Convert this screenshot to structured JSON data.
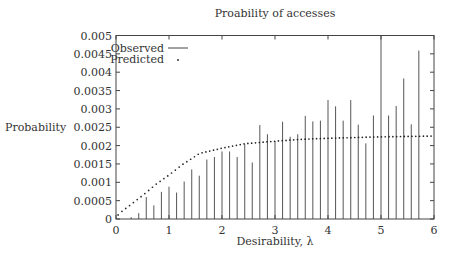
{
  "chart_data": {
    "type": "bar",
    "title": "Proability of accesses",
    "xlabel": "Desirability, λ",
    "ylabel": "Probability",
    "xlim": [
      0,
      6
    ],
    "ylim": [
      0,
      0.005
    ],
    "grid": false,
    "legend_position": "top-left",
    "x_ticks": [
      "0",
      "1",
      "2",
      "3",
      "4",
      "5",
      "6"
    ],
    "y_ticks": [
      "0",
      "0.0005",
      "0.001",
      "0.0015",
      "0.002",
      "0.0025",
      "0.003",
      "0.0035",
      "0.004",
      "0.0045",
      "0.005"
    ],
    "series": [
      {
        "name": "Observed",
        "style": "impulses",
        "x": [
          0.143,
          0.286,
          0.429,
          0.571,
          0.714,
          0.857,
          1.0,
          1.143,
          1.286,
          1.429,
          1.571,
          1.714,
          1.857,
          2.0,
          2.143,
          2.286,
          2.429,
          2.571,
          2.714,
          2.857,
          3.0,
          3.143,
          3.286,
          3.429,
          3.571,
          3.714,
          3.857,
          4.0,
          4.143,
          4.286,
          4.429,
          4.571,
          4.714,
          4.857,
          5.0,
          5.143,
          5.286,
          5.429,
          5.571,
          5.714
        ],
        "values": [
          0.0,
          5e-05,
          0.00016,
          0.0006,
          0.00037,
          0.00074,
          0.00088,
          0.00072,
          0.00102,
          0.00135,
          0.00118,
          0.00162,
          0.00169,
          0.00184,
          0.00184,
          0.00169,
          0.00204,
          0.00154,
          0.00256,
          0.00231,
          0.00212,
          0.00265,
          0.00224,
          0.00231,
          0.00281,
          0.00266,
          0.00268,
          0.00324,
          0.00307,
          0.00268,
          0.00324,
          0.00257,
          0.00206,
          0.00282,
          0.0052,
          0.00282,
          0.00308,
          0.00383,
          0.00258,
          0.00459
        ]
      },
      {
        "name": "Predicted",
        "style": "dotted-curve",
        "x": [
          0.0,
          0.05,
          0.25,
          0.5,
          0.75,
          1.0,
          1.25,
          1.58,
          1.8,
          2.0,
          2.42,
          3.0,
          3.47,
          4.0,
          5.0,
          6.0
        ],
        "values": [
          0.0,
          0.00014,
          0.00036,
          0.00064,
          0.00094,
          0.0012,
          0.00148,
          0.00179,
          0.00186,
          0.00193,
          0.00205,
          0.00212,
          0.00217,
          0.0022,
          0.00224,
          0.00226
        ]
      }
    ]
  }
}
